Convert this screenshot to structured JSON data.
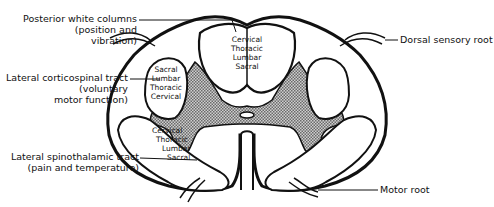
{
  "diagram": {
    "labels": {
      "posterior_white_columns": {
        "line1": "Posterior white columns",
        "line2": "(position and",
        "line3": "vibration)"
      },
      "lateral_corticospinal": {
        "line1": "Lateral corticospinal tract",
        "line2": "(voluntary",
        "line3": "motor function)"
      },
      "lateral_spinothalamic": {
        "line1": "Lateral spinothalamic tract",
        "line2": "(pain and temperature)"
      },
      "dorsal_sensory_root": "Dorsal sensory root",
      "motor_root": "Motor root"
    },
    "tract_layers": {
      "posterior": [
        "Cervical",
        "Thoracic",
        "Lumbar",
        "Sacral"
      ],
      "corticospinal": [
        "Sacral",
        "Lumbar",
        "Thoracic",
        "Cervical"
      ],
      "spinothalamic": [
        "Cervical",
        "Thoracic",
        "Lumbar",
        "Sacral"
      ]
    },
    "colors": {
      "outline": "#111111",
      "gray_matter": "#9a9a9a",
      "background": "#ffffff"
    }
  }
}
